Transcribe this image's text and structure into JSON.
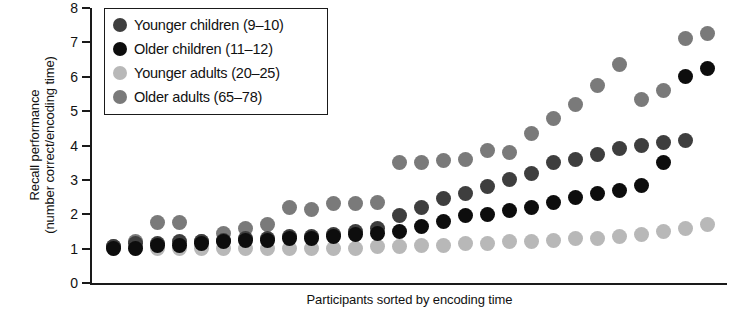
{
  "chart_data": {
    "type": "scatter",
    "title": "",
    "xlabel": "Participants sorted by encoding time",
    "ylabel_line1": "Recall performance",
    "ylabel_line2": "(number correct/encoding time)",
    "ylim": [
      0,
      8
    ],
    "yticks": [
      0,
      1,
      2,
      3,
      4,
      5,
      6,
      7,
      8
    ],
    "xlim": [
      0,
      29
    ],
    "xticks": [],
    "grid": false,
    "legend_position": "top-left",
    "series": [
      {
        "name": "Younger children (9-10)",
        "label": "Younger children (9–10)",
        "color": "#3e3e3e",
        "x": [
          1,
          2,
          3,
          4,
          5,
          6,
          7,
          8,
          9,
          10,
          11,
          12,
          13,
          14,
          15,
          16,
          17,
          18,
          19,
          20,
          21,
          22,
          23,
          24,
          25,
          26,
          27
        ],
        "y": [
          1.05,
          1.15,
          1.15,
          1.2,
          1.2,
          1.25,
          1.3,
          1.3,
          1.35,
          1.35,
          1.4,
          1.5,
          1.6,
          1.95,
          2.2,
          2.45,
          2.6,
          2.8,
          3.0,
          3.2,
          3.5,
          3.6,
          3.75,
          3.9,
          4.0,
          4.1,
          4.15
        ]
      },
      {
        "name": "Older children (11-12)",
        "label": "Older children (11–12)",
        "color": "#0d0d0d",
        "x": [
          1,
          2,
          3,
          4,
          5,
          6,
          7,
          8,
          9,
          10,
          11,
          12,
          13,
          14,
          15,
          16,
          17,
          18,
          19,
          20,
          21,
          22,
          23,
          24,
          25,
          26,
          27,
          28
        ],
        "y": [
          1.0,
          1.0,
          1.1,
          1.1,
          1.15,
          1.2,
          1.25,
          1.25,
          1.3,
          1.3,
          1.35,
          1.4,
          1.45,
          1.5,
          1.65,
          1.8,
          1.95,
          2.0,
          2.1,
          2.2,
          2.35,
          2.5,
          2.6,
          2.7,
          2.85,
          3.5,
          6.0,
          6.25
        ]
      },
      {
        "name": "Younger adults (20-25)",
        "label": "Younger adults (20–25)",
        "color": "#b8b8b8",
        "x": [
          1,
          2,
          3,
          4,
          5,
          6,
          7,
          8,
          9,
          10,
          11,
          12,
          13,
          14,
          15,
          16,
          17,
          18,
          19,
          20,
          21,
          22,
          23,
          24,
          25,
          26,
          27,
          28
        ],
        "y": [
          1.0,
          1.0,
          1.0,
          1.0,
          1.0,
          1.0,
          1.0,
          1.0,
          1.0,
          1.0,
          1.0,
          1.0,
          1.05,
          1.05,
          1.1,
          1.1,
          1.15,
          1.15,
          1.2,
          1.2,
          1.25,
          1.3,
          1.3,
          1.35,
          1.4,
          1.5,
          1.6,
          1.7
        ]
      },
      {
        "name": "Older adults (65-78)",
        "label": "Older adults (65–78)",
        "color": "#7a7a7a",
        "x": [
          1,
          2,
          3,
          4,
          5,
          6,
          7,
          8,
          9,
          10,
          11,
          12,
          13,
          14,
          15,
          16,
          17,
          18,
          19,
          20,
          21,
          22,
          23,
          24,
          25,
          26,
          27,
          28
        ],
        "y": [
          1.05,
          1.2,
          1.75,
          1.75,
          1.2,
          1.45,
          1.6,
          1.7,
          2.2,
          2.15,
          2.3,
          2.3,
          2.35,
          3.5,
          3.5,
          3.55,
          3.6,
          3.85,
          3.8,
          4.35,
          4.8,
          5.2,
          5.75,
          6.35,
          5.35,
          5.6,
          7.1,
          7.25
        ]
      }
    ]
  },
  "legend": {
    "entries": [
      {
        "label": "Younger children (9–10)",
        "color": "#3e3e3e"
      },
      {
        "label": "Older children (11–12)",
        "color": "#0d0d0d"
      },
      {
        "label": "Younger adults (20–25)",
        "color": "#b8b8b8"
      },
      {
        "label": "Older adults (65–78)",
        "color": "#7a7a7a"
      }
    ]
  },
  "axes": {
    "y_title_line1": "Recall performance",
    "y_title_line2": "(number correct/encoding time)",
    "x_title": "Participants sorted by encoding time",
    "y_tick_labels": [
      "8",
      "7",
      "6",
      "5",
      "4",
      "3",
      "2",
      "1",
      "0"
    ]
  },
  "colors": {
    "axis": "#1a1a1a",
    "background": "#ffffff",
    "younger_children": "#3e3e3e",
    "older_children": "#0d0d0d",
    "younger_adults": "#b8b8b8",
    "older_adults": "#7a7a7a"
  }
}
